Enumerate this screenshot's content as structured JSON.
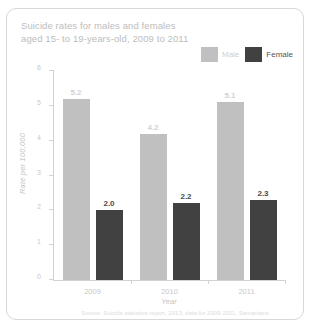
{
  "card": {
    "title_line1": "Suicide rates for males and females",
    "title_line2": "aged 15- to 19-years-old, 2009 to 2011"
  },
  "legend": {
    "male_label": "Male",
    "female_label": "Female",
    "male_color": "#c0c0c0",
    "female_color": "#414141"
  },
  "chart_data": {
    "type": "bar",
    "title": "Suicide rates for males and females aged 15- to 19-years-old, 2009 to 2011",
    "categories": [
      "2009",
      "2010",
      "2011"
    ],
    "series": [
      {
        "name": "Male",
        "values": [
          5.2,
          4.2,
          5.1
        ],
        "color": "#c0c0c0"
      },
      {
        "name": "Female",
        "values": [
          2.0,
          2.2,
          2.3
        ],
        "color": "#414141"
      }
    ],
    "value_labels": {
      "male": [
        "5.2",
        "4.2",
        "5.1"
      ],
      "female": [
        "2.0",
        "2.2",
        "2.3"
      ]
    },
    "xlabel": "Year",
    "ylabel": "Rate per 100,000",
    "ylim": [
      0,
      6
    ],
    "yticks": [
      "6",
      "5",
      "4",
      "3",
      "2",
      "1",
      "0"
    ],
    "grid": false,
    "legend_position": "top-right",
    "source": "Source: Suicide statistics report, 2013, data for 2009-2011, Samaritans"
  }
}
